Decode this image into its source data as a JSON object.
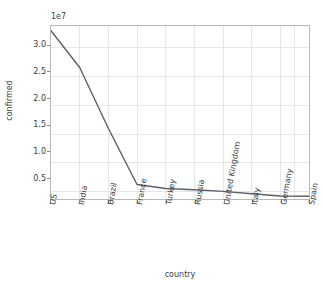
{
  "chart_data": {
    "type": "line",
    "title": "",
    "subtitle": "",
    "xlabel": "country",
    "ylabel": "confirmed",
    "offset_label": "1e7",
    "categories": [
      "US",
      "India",
      "Brazil",
      "France",
      "Turkey",
      "Russia",
      "United Kingdom",
      "Italy",
      "Germany",
      "Spain"
    ],
    "values": [
      33000000,
      26600000,
      16000000,
      6200000,
      5500000,
      5300000,
      5000000,
      4600000,
      4200000,
      4150000
    ],
    "values_scaled": [
      3.3,
      2.66,
      1.6,
      0.62,
      0.55,
      0.53,
      0.5,
      0.46,
      0.42,
      0.415
    ],
    "y_tick_labels": [
      "3.0",
      "2.5",
      "2.0",
      "1.5",
      "1.0",
      "0.5"
    ],
    "y_tick_values": [
      30000000,
      25000000,
      20000000,
      15000000,
      10000000,
      5000000
    ],
    "ylim": [
      3500000,
      34000000
    ],
    "grid": true,
    "legend": "none",
    "series": [
      {
        "name": "confirmed",
        "color": "#5a616b",
        "values": [
          33000000,
          26600000,
          16000000,
          6200000,
          5500000,
          5300000,
          5000000,
          4600000,
          4200000,
          4150000
        ]
      }
    ],
    "colors": {
      "line": "#5a616b",
      "grid": "#e6e6e6",
      "spine": "#b8b8b8",
      "text": "#3c3c3c",
      "background": "#ffffff"
    }
  }
}
